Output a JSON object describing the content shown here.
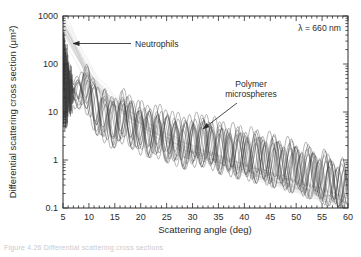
{
  "figure": {
    "caption_sliver": "Figure  4.26    Differential scattering cross sections"
  },
  "chart_data": {
    "type": "line",
    "title": "",
    "xlabel": "Scattering angle (deg)",
    "ylabel": "Differential scattering cross section (μm²)",
    "xscale": "linear",
    "yscale": "log",
    "xlim": [
      5,
      60
    ],
    "ylim": [
      0.1,
      1000
    ],
    "grid": false,
    "legend_position": "none",
    "xticks": [
      5,
      10,
      15,
      20,
      25,
      30,
      35,
      40,
      45,
      50,
      55,
      60
    ],
    "xtick_labels": [
      "5",
      "10",
      "15",
      "20",
      "25",
      "30",
      "35",
      "40",
      "45",
      "50",
      "55",
      "60"
    ],
    "yticks": [
      0.1,
      1,
      10,
      100,
      1000
    ],
    "ytick_labels": [
      "0.1",
      "1",
      "10",
      "100",
      "1000"
    ],
    "minor_ticks": true,
    "annotations": [
      {
        "name": "wavelength",
        "text": "λ = 660 nm",
        "x_px": 341,
        "y_px": 31,
        "anchor": "end"
      },
      {
        "name": "neutrophils",
        "text": "Neutrophils",
        "x_px": 135,
        "y_px": 46,
        "anchor": "start",
        "arrow_from": [
          131,
          43
        ],
        "arrow_to": [
          72,
          43
        ]
      },
      {
        "name": "polymer-microspheres",
        "text_line1": "Polymer",
        "text_line2": "microspheres",
        "x_px": 249,
        "y_px": 92,
        "anchor": "middle",
        "arrow_from": [
          237,
          104
        ],
        "arrow_to": [
          202,
          130
        ]
      }
    ],
    "series": [
      {
        "name": "Neutrophils",
        "color": "#c4c4c4",
        "n_traces": 22,
        "style": "light-gray bundle, monotonic steep decay, no ripples",
        "comment": "Starts near 600 um^2 at 5 deg, falls to ~0.12 um^2 by 60 deg",
        "x": [
          5,
          6,
          7,
          8,
          9,
          10,
          12,
          14,
          16,
          18,
          20,
          22,
          25,
          28,
          31,
          34,
          37,
          40,
          44,
          48,
          52,
          56,
          60
        ],
        "y": [
          600,
          400,
          250,
          150,
          90,
          60,
          30,
          18,
          12,
          8.5,
          6.0,
          4.4,
          2.9,
          2.0,
          1.45,
          1.1,
          0.85,
          0.66,
          0.47,
          0.34,
          0.25,
          0.18,
          0.13
        ]
      },
      {
        "name": "Polymer microspheres",
        "color": "#3a3a3a",
        "n_traces": 14,
        "style": "dark bundle with strong Mie oscillations on decaying envelope",
        "comment": "Envelope falls from ~45 um^2 at 5 deg to ~0.2 um^2 at 60 deg; ripple period ~3.4 deg",
        "envelope_x": [
          5,
          7,
          9,
          11,
          14,
          17,
          20,
          24,
          28,
          32,
          36,
          40,
          45,
          50,
          55,
          60
        ],
        "envelope_y": [
          45,
          22,
          36,
          14,
          6.0,
          8.0,
          4.4,
          3.6,
          2.3,
          2.6,
          1.7,
          1.35,
          1.0,
          0.7,
          0.45,
          0.25
        ],
        "ripple_period_deg": 3.4,
        "ripple_amplitude_decades": 0.42
      }
    ]
  }
}
